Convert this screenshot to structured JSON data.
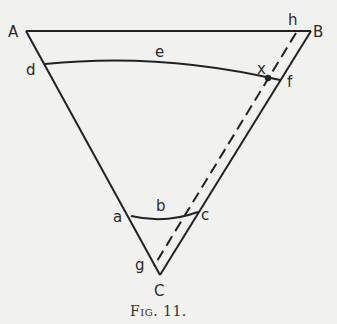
{
  "figure": {
    "caption": "Fig. 11.",
    "labels": {
      "A": "A",
      "B": "B",
      "C": "C",
      "a": "a",
      "b": "b",
      "c": "c",
      "d": "d",
      "e": "e",
      "f": "f",
      "g": "g",
      "h": "h",
      "x": "x"
    },
    "colors": {
      "line": "#222222",
      "background": "#f1f1ef"
    }
  }
}
